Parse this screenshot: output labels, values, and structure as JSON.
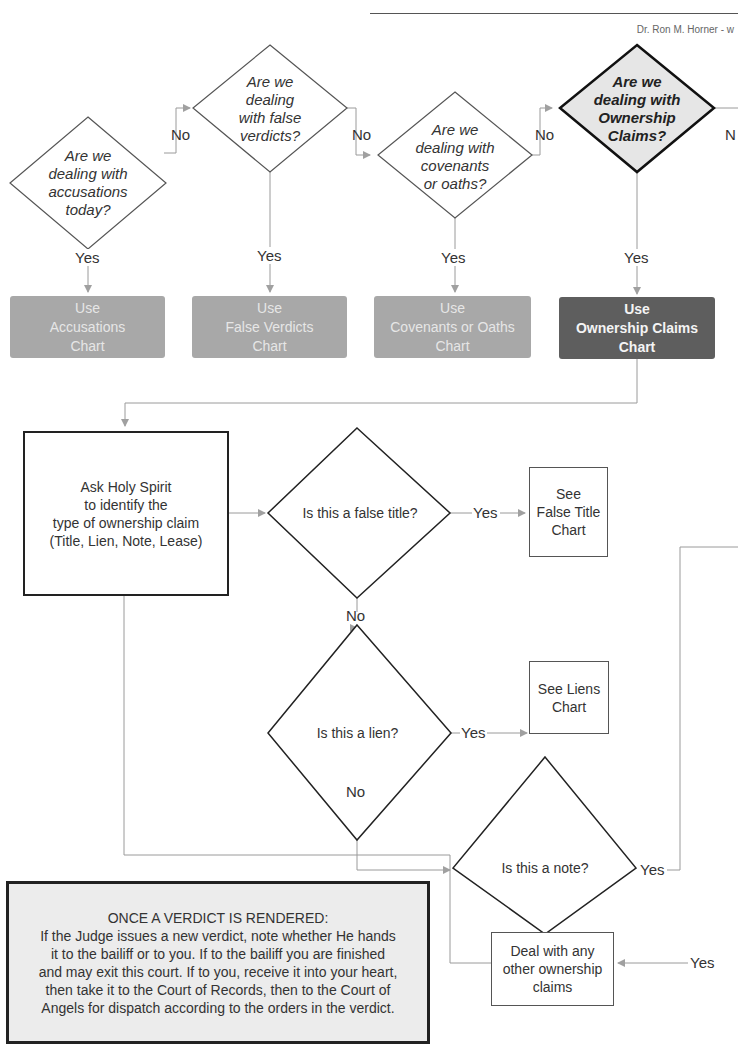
{
  "header": {
    "author": "Dr. Ron M. Horner - w"
  },
  "top_questions": [
    {
      "id": "q1",
      "text_lines": [
        "Are we",
        "dealing with",
        "accusations",
        "today?"
      ],
      "highlighted": false,
      "no_label": "No",
      "yes_label": "Yes"
    },
    {
      "id": "q2",
      "text_lines": [
        "Are we",
        "dealing",
        "with false",
        "verdicts?"
      ],
      "highlighted": false,
      "no_label": "No",
      "yes_label": "Yes"
    },
    {
      "id": "q3",
      "text_lines": [
        "Are we",
        "dealing with",
        "covenants",
        "or oaths?"
      ],
      "highlighted": false,
      "no_label": "No",
      "yes_label": "Yes"
    },
    {
      "id": "q4",
      "text_lines": [
        "Are we",
        "dealing with",
        "Ownership",
        "Claims?"
      ],
      "highlighted": true,
      "no_label": "N",
      "yes_label": "Yes"
    }
  ],
  "chart_boxes": [
    {
      "lines": [
        "Use",
        "Accusations",
        "Chart"
      ],
      "style": "light"
    },
    {
      "lines": [
        "Use",
        "False Verdicts",
        "Chart"
      ],
      "style": "light"
    },
    {
      "lines": [
        "Use",
        "Covenants or Oaths",
        "Chart"
      ],
      "style": "light"
    },
    {
      "lines": [
        "Use",
        "Ownership Claims",
        "Chart"
      ],
      "style": "dark"
    }
  ],
  "ask_box": {
    "lines": [
      "Ask Holy Spirit",
      "to identify the",
      "type of ownership claim",
      "(Title, Lien, Note, Lease)"
    ]
  },
  "decisions": {
    "false_title": {
      "text": "Is this a false title?",
      "yes_label": "Yes",
      "no_label": "No"
    },
    "lien": {
      "text": "Is this a lien?",
      "yes_label": "Yes",
      "no_label": "No"
    },
    "note": {
      "text": "Is this a note?",
      "yes_label": "Yes"
    }
  },
  "outcomes": {
    "false_title": {
      "lines": [
        "See",
        "False Title",
        "Chart"
      ]
    },
    "liens": {
      "lines": [
        "See Liens",
        "Chart"
      ]
    },
    "other_claims": {
      "lines": [
        "Deal with any",
        "other ownership",
        "claims"
      ],
      "yes_label": "Yes"
    }
  },
  "verdict_note": {
    "title": "ONCE A VERDICT IS RENDERED:",
    "lines": [
      "If the Judge issues a new verdict, note whether He hands",
      "it to the bailiff or to you. If to the bailiff you are finished",
      "and may exit this court. If to you, receive it into your heart,",
      "then take it to the Court of Records, then to the Court of",
      "Angels for dispatch according to the orders in the verdict."
    ]
  },
  "colors": {
    "chart_box_light": "#a8a8a8",
    "chart_box_dark": "#5e5e5e",
    "highlight_diamond_fill": "#e6e6e6",
    "connector": "#9a9a9a",
    "verdict_fill": "#ececec"
  }
}
